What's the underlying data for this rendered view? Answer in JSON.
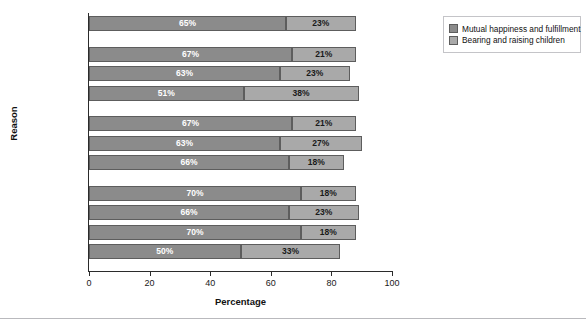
{
  "chart_data": {
    "type": "bar",
    "orientation": "horizontal",
    "stacked": true,
    "title": "",
    "xlabel": "Percentage",
    "ylabel": "Reason",
    "xlim": [
      0,
      100
    ],
    "xticks": [
      0,
      20,
      40,
      60,
      80,
      100
    ],
    "grid": false,
    "legend_position": "right",
    "categories": [
      "All Adults",
      "Black",
      "White",
      "Hispanic",
      "Protestant",
      "Catholic",
      "Secular",
      "18–29",
      "30–49",
      "50–64",
      "65+"
    ],
    "groups": [
      {
        "name": "overall",
        "categories": [
          "All Adults"
        ]
      },
      {
        "name": "race",
        "categories": [
          "Black",
          "White",
          "Hispanic"
        ]
      },
      {
        "name": "religion",
        "categories": [
          "Protestant",
          "Catholic",
          "Secular"
        ]
      },
      {
        "name": "age",
        "categories": [
          "18–29",
          "30–49",
          "50–64",
          "65+"
        ]
      }
    ],
    "series": [
      {
        "name": "Mutual happiness and fulfillment",
        "color": "#8b8b8b",
        "values": [
          65,
          67,
          63,
          51,
          67,
          63,
          66,
          70,
          66,
          70,
          50
        ],
        "labels": [
          "65%",
          "67%",
          "63%",
          "51%",
          "67%",
          "63%",
          "66%",
          "70%",
          "66%",
          "70%",
          "50%"
        ]
      },
      {
        "name": "Bearing and raising children",
        "color": "#a9a9a9",
        "values": [
          23,
          21,
          23,
          38,
          21,
          27,
          18,
          18,
          23,
          18,
          33
        ],
        "labels": [
          "23%",
          "21%",
          "23%",
          "38%",
          "21%",
          "27%",
          "18%",
          "18%",
          "23%",
          "18%",
          "33%"
        ]
      }
    ]
  },
  "legend": {
    "items": [
      {
        "label": "Mutual happiness and fulfillment",
        "color": "#8b8b8b"
      },
      {
        "label": "Bearing and raising children",
        "color": "#a9a9a9"
      }
    ]
  },
  "axis": {
    "x_tick_labels": [
      "0",
      "20",
      "40",
      "60",
      "80",
      "100"
    ],
    "x_title": "Percentage",
    "y_title": "Reason"
  }
}
